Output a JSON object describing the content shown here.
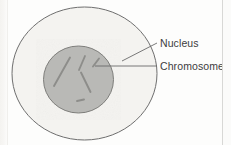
{
  "figure": {
    "type": "biology-diagram",
    "parts": [
      {
        "id": "cell",
        "name": "Cell",
        "shape": "ellipse",
        "fill": "#f4f3f0",
        "stroke": "#6e6e6e",
        "cx": 84.5,
        "cy": 73.5,
        "rx": 72.5,
        "ry": 66.5
      },
      {
        "id": "nucleus",
        "name": "Nucleus",
        "shape": "ellipse",
        "fill": "#b9b9b6",
        "stroke": "#7d7d7a",
        "cx": 78.5,
        "cy": 79.5,
        "rx": 35.0,
        "ry": 33.5
      }
    ],
    "chromosomes": {
      "name": "Chromosome",
      "color": "#8d8d8a",
      "segments": [
        {
          "x1": 70.0,
          "y1": 57.5,
          "x2": 54.0,
          "y2": 86.0
        },
        {
          "x1": 85.0,
          "y1": 56.0,
          "x2": 79.0,
          "y2": 70.0
        },
        {
          "x1": 99.0,
          "y1": 58.5,
          "x2": 93.0,
          "y2": 66.5
        },
        {
          "x1": 81.0,
          "y1": 72.5,
          "x2": 90.5,
          "y2": 92.0
        },
        {
          "x1": 77.0,
          "y1": 101.0,
          "x2": 84.0,
          "y2": 99.5
        }
      ]
    },
    "leaders": [
      {
        "id": "leader-nucleus",
        "for": "Nucleus",
        "color": "#6a6a6a",
        "x1": 122.0,
        "y1": 61.0,
        "x2": 157.0,
        "y2": 43.0
      },
      {
        "id": "leader-chromosome",
        "for": "Chromosome",
        "color": "#6a6a6a",
        "x1": 95.0,
        "y1": 66.0,
        "x2": 157.0,
        "y2": 66.0
      }
    ]
  },
  "labels": {
    "nucleus": "Nucleus",
    "chromosome": "Chromosome"
  },
  "colors": {
    "background": "#fdfdfc",
    "cell_fill": "#f4f3f0",
    "cell_stroke": "#6e6e6e",
    "nucleus_fill": "#b9b9b6",
    "nucleus_stroke": "#7d7d7a",
    "chromosome": "#8d8d8a",
    "leader": "#6a6a6a",
    "label_text": "#3c3c3c"
  }
}
